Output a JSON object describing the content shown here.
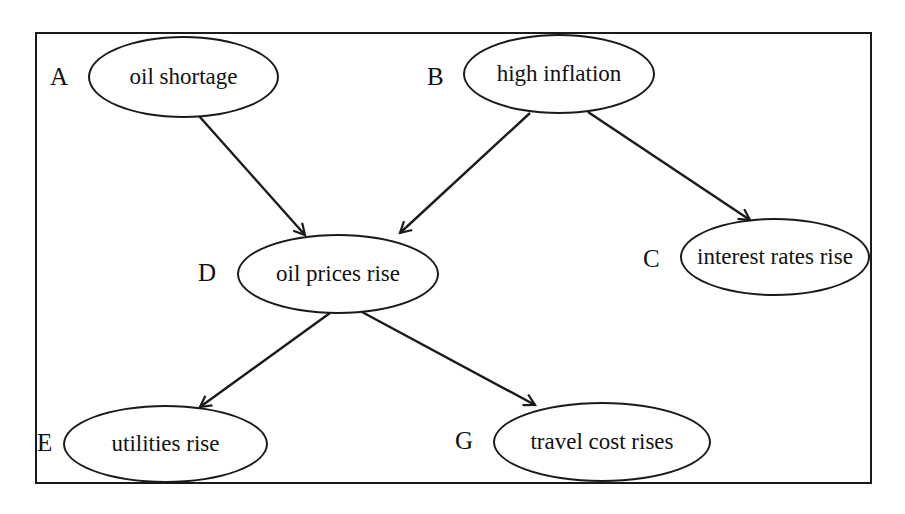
{
  "diagram": {
    "type": "causal network / directed graph",
    "nodes": [
      {
        "id": "A",
        "letter": "A",
        "label": "oil shortage"
      },
      {
        "id": "B",
        "letter": "B",
        "label": "high inflation"
      },
      {
        "id": "C",
        "letter": "C",
        "label": "interest rates rise"
      },
      {
        "id": "D",
        "letter": "D",
        "label": "oil prices rise"
      },
      {
        "id": "E",
        "letter": "E",
        "label": "utilities rise"
      },
      {
        "id": "G",
        "letter": "G",
        "label": "travel cost rises"
      }
    ],
    "edges": [
      {
        "from": "A",
        "to": "D"
      },
      {
        "from": "B",
        "to": "D"
      },
      {
        "from": "B",
        "to": "C"
      },
      {
        "from": "D",
        "to": "E"
      },
      {
        "from": "D",
        "to": "G"
      }
    ]
  },
  "colors": {
    "stroke": "#1a1a1a",
    "background": "#ffffff",
    "text": "#111111"
  }
}
